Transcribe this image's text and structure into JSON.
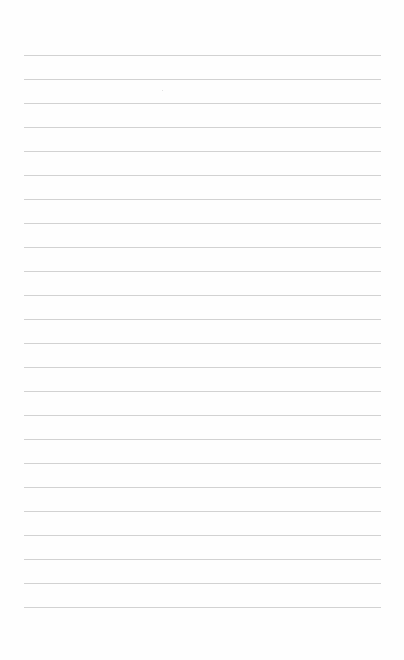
{
  "page": {
    "type": "lined-paper",
    "background_color": "#fefefe",
    "line_color": "#d2d2d2",
    "line_left": 24,
    "line_width": 357,
    "first_line_y": 55,
    "line_spacing": 24,
    "line_count": 24,
    "lines": [
      {
        "y": 55,
        "text": ""
      },
      {
        "y": 79,
        "text": ""
      },
      {
        "y": 103,
        "text": ""
      },
      {
        "y": 127,
        "text": ""
      },
      {
        "y": 151,
        "text": ""
      },
      {
        "y": 175,
        "text": ""
      },
      {
        "y": 199,
        "text": ""
      },
      {
        "y": 223,
        "text": ""
      },
      {
        "y": 247,
        "text": ""
      },
      {
        "y": 271,
        "text": ""
      },
      {
        "y": 295,
        "text": ""
      },
      {
        "y": 319,
        "text": ""
      },
      {
        "y": 343,
        "text": ""
      },
      {
        "y": 367,
        "text": ""
      },
      {
        "y": 391,
        "text": ""
      },
      {
        "y": 415,
        "text": ""
      },
      {
        "y": 439,
        "text": ""
      },
      {
        "y": 463,
        "text": ""
      },
      {
        "y": 487,
        "text": ""
      },
      {
        "y": 511,
        "text": ""
      },
      {
        "y": 535,
        "text": ""
      },
      {
        "y": 559,
        "text": ""
      },
      {
        "y": 583,
        "text": ""
      },
      {
        "y": 607,
        "text": ""
      }
    ]
  }
}
